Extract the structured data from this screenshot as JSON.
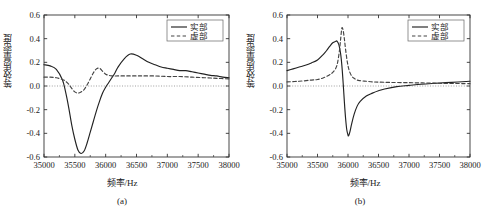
{
  "figure": {
    "panels": [
      {
        "id": "a",
        "caption": "(a)",
        "xlabel": "频率/Hz",
        "ylabel": "等效质量密度",
        "legend": [
          {
            "label": "实部",
            "style": "solid"
          },
          {
            "label": "虚部",
            "style": "dashed"
          }
        ],
        "xticks": [
          "35000",
          "35500",
          "36000",
          "36500",
          "37000",
          "37500",
          "38000"
        ],
        "yticks": [
          "0.6",
          "0.4",
          "0.2",
          "0.0",
          "-0.2",
          "-0.4",
          "-0.6"
        ]
      },
      {
        "id": "b",
        "caption": "(b)",
        "xlabel": "频率/Hz",
        "ylabel": "等效质量密度",
        "legend": [
          {
            "label": "实部",
            "style": "solid"
          },
          {
            "label": "虚部",
            "style": "dashed"
          }
        ],
        "xticks": [
          "35000",
          "35500",
          "36000",
          "36500",
          "37000",
          "37500",
          "38000"
        ],
        "yticks": [
          "0.6",
          "0.4",
          "0.2",
          "0.0",
          "-0.2",
          "-0.4",
          "-0.6"
        ]
      }
    ]
  },
  "chart_data": [
    {
      "type": "line",
      "title": "",
      "subtitle": "(a)",
      "xlabel": "频率/Hz",
      "ylabel": "等效质量密度",
      "xlim": [
        35000,
        38000
      ],
      "ylim": [
        -0.6,
        0.6
      ],
      "xticks": [
        35000,
        35500,
        36000,
        36500,
        37000,
        37500,
        38000
      ],
      "yticks": [
        -0.6,
        -0.4,
        -0.2,
        0.0,
        0.2,
        0.4,
        0.6
      ],
      "grid": false,
      "legend_position": "top-right",
      "zero_line": true,
      "series": [
        {
          "name": "实部",
          "style": "solid",
          "color": "#222222",
          "x": [
            35000,
            35100,
            35200,
            35300,
            35350,
            35400,
            35450,
            35500,
            35550,
            35600,
            35650,
            35700,
            35750,
            35800,
            35850,
            35900,
            35950,
            36000,
            36050,
            36100,
            36150,
            36200,
            36300,
            36400,
            36500,
            36600,
            36700,
            36800,
            36900,
            37000,
            37100,
            37200,
            37300,
            37400,
            37500,
            37600,
            37700,
            37800,
            37900,
            38000
          ],
          "y": [
            0.18,
            0.17,
            0.14,
            0.05,
            -0.05,
            -0.18,
            -0.33,
            -0.45,
            -0.54,
            -0.57,
            -0.55,
            -0.48,
            -0.39,
            -0.3,
            -0.21,
            -0.13,
            -0.06,
            -0.01,
            0.03,
            0.07,
            0.11,
            0.16,
            0.23,
            0.27,
            0.26,
            0.23,
            0.2,
            0.18,
            0.16,
            0.15,
            0.14,
            0.13,
            0.13,
            0.12,
            0.11,
            0.1,
            0.09,
            0.085,
            0.075,
            0.07
          ]
        },
        {
          "name": "虚部",
          "style": "dashed",
          "color": "#444444",
          "x": [
            35000,
            35100,
            35200,
            35300,
            35350,
            35400,
            35450,
            35500,
            35550,
            35600,
            35650,
            35700,
            35750,
            35800,
            35850,
            35900,
            35950,
            36000,
            36050,
            36100,
            36200,
            36300,
            36400,
            36500,
            36600,
            36800,
            37000,
            37200,
            37400,
            37600,
            37800,
            38000
          ],
          "y": [
            0.075,
            0.075,
            0.07,
            0.055,
            0.04,
            0.015,
            -0.02,
            -0.05,
            -0.06,
            -0.05,
            -0.03,
            0.01,
            0.06,
            0.11,
            0.145,
            0.15,
            0.125,
            0.1,
            0.09,
            0.085,
            0.085,
            0.085,
            0.085,
            0.085,
            0.085,
            0.085,
            0.08,
            0.08,
            0.075,
            0.07,
            0.065,
            0.06
          ]
        }
      ]
    },
    {
      "type": "line",
      "title": "",
      "subtitle": "(b)",
      "xlabel": "频率/Hz",
      "ylabel": "等效质量密度",
      "xlim": [
        35000,
        38000
      ],
      "ylim": [
        -0.6,
        0.6
      ],
      "xticks": [
        35000,
        35500,
        36000,
        36500,
        37000,
        37500,
        38000
      ],
      "yticks": [
        -0.6,
        -0.4,
        -0.2,
        0.0,
        0.2,
        0.4,
        0.6
      ],
      "grid": false,
      "legend_position": "top-right",
      "zero_line": true,
      "series": [
        {
          "name": "实部",
          "style": "solid",
          "color": "#222222",
          "x": [
            35000,
            35100,
            35200,
            35300,
            35400,
            35500,
            35600,
            35650,
            35700,
            35750,
            35800,
            35820,
            35850,
            35880,
            35900,
            35920,
            35940,
            35960,
            35980,
            36000,
            36010,
            36030,
            36060,
            36100,
            36150,
            36200,
            36300,
            36400,
            36500,
            36600,
            36800,
            37000,
            37200,
            37400,
            37600,
            37800,
            38000
          ],
          "y": [
            0.13,
            0.145,
            0.16,
            0.175,
            0.195,
            0.22,
            0.27,
            0.3,
            0.335,
            0.365,
            0.378,
            0.38,
            0.35,
            0.27,
            0.17,
            0.03,
            -0.13,
            -0.27,
            -0.37,
            -0.415,
            -0.42,
            -0.39,
            -0.32,
            -0.24,
            -0.17,
            -0.13,
            -0.085,
            -0.06,
            -0.04,
            -0.025,
            -0.005,
            0.005,
            0.015,
            0.022,
            0.028,
            0.034,
            0.04
          ]
        },
        {
          "name": "虚部",
          "style": "dashed",
          "color": "#444444",
          "x": [
            35000,
            35200,
            35400,
            35500,
            35600,
            35700,
            35750,
            35800,
            35830,
            35860,
            35880,
            35900,
            35920,
            35940,
            35960,
            35990,
            36020,
            36060,
            36100,
            36150,
            36200,
            36300,
            36400,
            36500,
            36700,
            37000,
            37300,
            37600,
            38000
          ],
          "y": [
            0.035,
            0.04,
            0.05,
            0.055,
            0.07,
            0.095,
            0.115,
            0.15,
            0.2,
            0.3,
            0.4,
            0.49,
            0.47,
            0.4,
            0.31,
            0.2,
            0.13,
            0.085,
            0.065,
            0.05,
            0.045,
            0.04,
            0.035,
            0.033,
            0.03,
            0.028,
            0.025,
            0.022,
            0.02
          ]
        }
      ]
    }
  ]
}
